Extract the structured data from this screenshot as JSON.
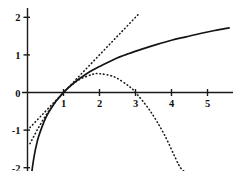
{
  "chart_data": {
    "type": "line",
    "title": "",
    "subtitle": "",
    "xlabel": "",
    "ylabel": "",
    "xlim": [
      -0.15,
      5.7
    ],
    "ylim": [
      -2.15,
      2.15
    ],
    "grid": false,
    "legend_position": "none",
    "background_color": "#ffffff",
    "line_color": "#141414",
    "x_ticks": [
      {
        "value": 1,
        "label": "1"
      },
      {
        "value": 2,
        "label": "2"
      },
      {
        "value": 3,
        "label": "3"
      },
      {
        "value": 4,
        "label": "4"
      },
      {
        "value": 5,
        "label": "5"
      },
      {
        "value": 6,
        "label": "6"
      }
    ],
    "y_ticks": [
      {
        "value": 2,
        "label": "2"
      },
      {
        "value": 1,
        "label": "1"
      },
      {
        "value": 0,
        "label": "0"
      },
      {
        "value": -1,
        "label": "-1"
      },
      {
        "value": -2,
        "label": "-2"
      }
    ],
    "series": [
      {
        "name": "ln(x)",
        "style": "solid",
        "x": [
          0.12,
          0.15,
          0.2,
          0.25,
          0.3,
          0.4,
          0.5,
          0.6,
          0.7,
          0.8,
          0.9,
          1.0,
          1.2,
          1.4,
          1.6,
          1.8,
          2.0,
          2.4,
          2.8,
          3.2,
          3.6,
          4.0,
          4.4,
          4.8,
          5.2,
          5.6
        ],
        "y": [
          -2.12,
          -1.9,
          -1.61,
          -1.39,
          -1.2,
          -0.92,
          -0.69,
          -0.51,
          -0.36,
          -0.22,
          -0.11,
          0.0,
          0.18,
          0.34,
          0.47,
          0.59,
          0.69,
          0.88,
          1.03,
          1.16,
          1.28,
          1.39,
          1.48,
          1.57,
          1.65,
          1.72
        ]
      },
      {
        "name": "(x-1)",
        "style": "dotted",
        "x": [
          0.07,
          0.4,
          0.8,
          1.0,
          1.4,
          1.8,
          2.2,
          2.6,
          3.0,
          3.1
        ],
        "y": [
          -0.93,
          -0.6,
          -0.2,
          0.0,
          0.4,
          0.8,
          1.2,
          1.6,
          2.0,
          2.1
        ]
      },
      {
        "name": "(x-1)-(x-1)^2/2",
        "style": "dotted",
        "x": [
          0.07,
          0.3,
          0.6,
          1.0,
          1.4,
          1.8,
          2.0,
          2.4,
          2.8,
          3.0,
          3.4,
          3.8,
          4.2,
          4.35
        ],
        "y": [
          -1.36,
          -0.945,
          -0.48,
          0.0,
          0.32,
          0.48,
          0.5,
          0.42,
          0.18,
          0.0,
          -0.48,
          -1.12,
          -1.92,
          -2.1
        ]
      }
    ]
  }
}
